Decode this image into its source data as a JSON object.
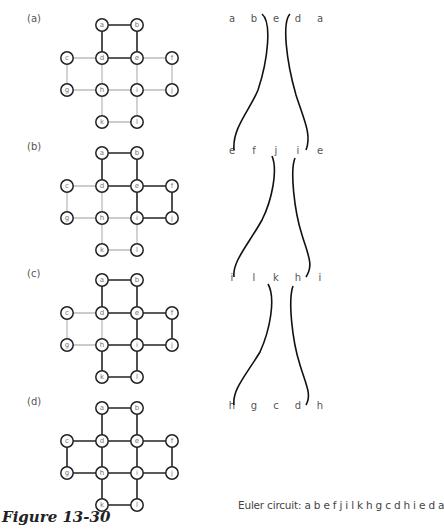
{
  "figure": {
    "caption": "Figure 13-30",
    "euler_circuit_label": "Euler circuit: a b e f j i l k h g c d h i e d a"
  },
  "graph": {
    "nodes": [
      {
        "id": "a",
        "x": 102,
        "y": 0
      },
      {
        "id": "b",
        "x": 137,
        "y": 0
      },
      {
        "id": "c",
        "x": 67,
        "y": 33
      },
      {
        "id": "d",
        "x": 102,
        "y": 33
      },
      {
        "id": "e",
        "x": 137,
        "y": 33
      },
      {
        "id": "f",
        "x": 172,
        "y": 33
      },
      {
        "id": "g",
        "x": 67,
        "y": 65
      },
      {
        "id": "h",
        "x": 102,
        "y": 65
      },
      {
        "id": "i",
        "x": 137,
        "y": 65
      },
      {
        "id": "j",
        "x": 172,
        "y": 65
      },
      {
        "id": "k",
        "x": 102,
        "y": 97
      },
      {
        "id": "l",
        "x": 137,
        "y": 97
      }
    ],
    "edges": [
      [
        "a",
        "b"
      ],
      [
        "a",
        "d"
      ],
      [
        "b",
        "e"
      ],
      [
        "d",
        "e"
      ],
      [
        "c",
        "d"
      ],
      [
        "e",
        "f"
      ],
      [
        "c",
        "g"
      ],
      [
        "d",
        "h"
      ],
      [
        "e",
        "i"
      ],
      [
        "f",
        "j"
      ],
      [
        "g",
        "h"
      ],
      [
        "h",
        "i"
      ],
      [
        "i",
        "j"
      ],
      [
        "h",
        "k"
      ],
      [
        "i",
        "l"
      ],
      [
        "k",
        "l"
      ]
    ]
  },
  "panels": [
    {
      "label": "(a)",
      "offset_y": 25,
      "label_y": 22,
      "dark_edges": [
        [
          "a",
          "b"
        ],
        [
          "a",
          "d"
        ],
        [
          "b",
          "e"
        ],
        [
          "d",
          "e"
        ]
      ],
      "sequence": [
        "a",
        "b",
        "e",
        "d",
        "a"
      ],
      "seq_y": 22
    },
    {
      "label": "(b)",
      "offset_y": 153,
      "label_y": 150,
      "dark_edges": [
        [
          "a",
          "b"
        ],
        [
          "a",
          "d"
        ],
        [
          "b",
          "e"
        ],
        [
          "d",
          "e"
        ],
        [
          "e",
          "f"
        ],
        [
          "f",
          "j"
        ],
        [
          "e",
          "i"
        ],
        [
          "i",
          "j"
        ]
      ],
      "sequence": [
        "e",
        "f",
        "j",
        "i",
        "e"
      ],
      "seq_y": 154
    },
    {
      "label": "(c)",
      "offset_y": 280,
      "label_y": 277,
      "dark_edges": [
        [
          "a",
          "b"
        ],
        [
          "a",
          "d"
        ],
        [
          "b",
          "e"
        ],
        [
          "d",
          "e"
        ],
        [
          "e",
          "f"
        ],
        [
          "f",
          "j"
        ],
        [
          "e",
          "i"
        ],
        [
          "i",
          "j"
        ],
        [
          "h",
          "i"
        ],
        [
          "h",
          "k"
        ],
        [
          "i",
          "l"
        ],
        [
          "k",
          "l"
        ]
      ],
      "sequence": [
        "i",
        "l",
        "k",
        "h",
        "i"
      ],
      "seq_y": 281
    },
    {
      "label": "(d)",
      "offset_y": 408,
      "label_y": 405,
      "dark_edges": "all",
      "sequence": [
        "h",
        "g",
        "c",
        "d",
        "h"
      ],
      "seq_y": 409
    }
  ],
  "sequence_x": [
    232,
    254,
    276,
    298,
    320
  ]
}
